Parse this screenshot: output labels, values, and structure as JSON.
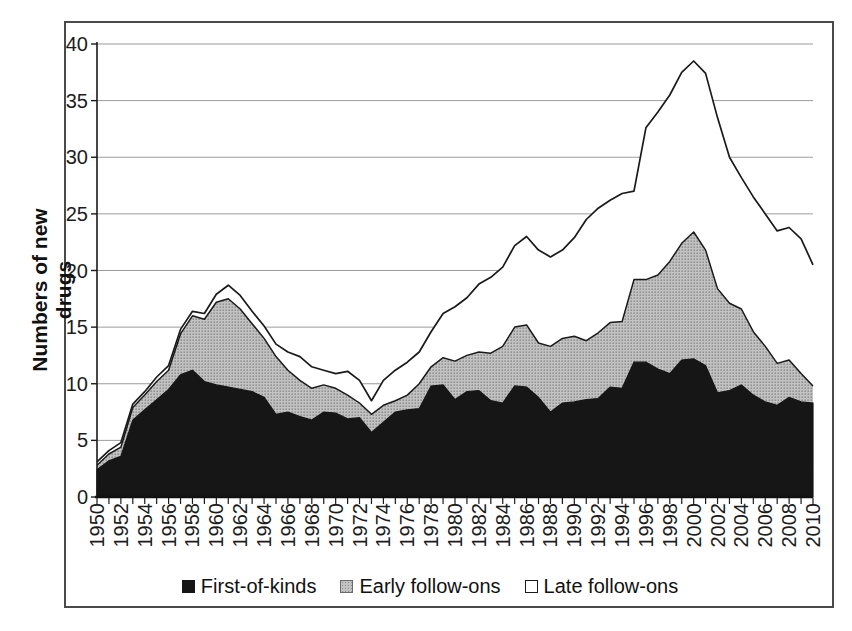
{
  "chart_data": {
    "type": "area",
    "stacked": true,
    "title": "",
    "xlabel": "",
    "ylabel": "Numbers of new drugs",
    "ylim": [
      0,
      40
    ],
    "ytick_step": 5,
    "grid": true,
    "legend_position": "bottom",
    "x": [
      1950,
      1951,
      1952,
      1953,
      1954,
      1955,
      1956,
      1957,
      1958,
      1959,
      1960,
      1961,
      1962,
      1963,
      1964,
      1965,
      1966,
      1967,
      1968,
      1969,
      1970,
      1971,
      1972,
      1973,
      1974,
      1975,
      1976,
      1977,
      1978,
      1979,
      1980,
      1981,
      1982,
      1983,
      1984,
      1985,
      1986,
      1987,
      1988,
      1989,
      1990,
      1991,
      1992,
      1993,
      1994,
      1995,
      1996,
      1997,
      1998,
      1999,
      2000,
      2001,
      2002,
      2003,
      2004,
      2005,
      2006,
      2007,
      2008,
      2009,
      2010
    ],
    "y_tick_labels": [
      "40",
      "35",
      "30",
      "25",
      "20",
      "15",
      "10",
      "5",
      "0"
    ],
    "x_tick_labels": [
      "1950",
      "1952",
      "1954",
      "1956",
      "1958",
      "1960",
      "1962",
      "1964",
      "1966",
      "1968",
      "1970",
      "1972",
      "1974",
      "1976",
      "1978",
      "1980",
      "1982",
      "1984",
      "1986",
      "1988",
      "1990",
      "1992",
      "1994",
      "1996",
      "1998",
      "2000",
      "2002",
      "2004",
      "2006",
      "2008",
      "2010"
    ],
    "series": [
      {
        "name": "First-of-kinds",
        "color": "#161616",
        "values": [
          2.4,
          3.2,
          3.6,
          6.8,
          7.7,
          8.6,
          9.5,
          10.8,
          11.2,
          10.2,
          9.9,
          9.7,
          9.5,
          9.3,
          8.8,
          7.3,
          7.5,
          7.1,
          6.8,
          7.5,
          7.4,
          6.9,
          7.0,
          5.7,
          6.6,
          7.5,
          7.7,
          7.8,
          9.8,
          9.9,
          8.6,
          9.3,
          9.4,
          8.5,
          8.3,
          9.8,
          9.7,
          8.8,
          7.5,
          8.3,
          8.4,
          8.6,
          8.7,
          9.7,
          9.6,
          11.9,
          11.9,
          11.3,
          10.9,
          12.1,
          12.2,
          11.6,
          9.2,
          9.4,
          9.9,
          9.0,
          8.4,
          8.1,
          8.8,
          8.4,
          8.3
        ]
      },
      {
        "name": "Early follow-ons",
        "color": "#b5b5b5",
        "values": [
          0.4,
          0.6,
          0.8,
          1.1,
          1.3,
          1.6,
          1.7,
          3.6,
          4.8,
          5.5,
          7.3,
          7.8,
          7.1,
          6.0,
          5.2,
          5.1,
          3.7,
          3.2,
          2.8,
          2.4,
          2.2,
          2.1,
          1.3,
          1.6,
          1.5,
          1.0,
          1.3,
          2.2,
          1.7,
          2.4,
          3.4,
          3.2,
          3.4,
          4.2,
          5.0,
          5.2,
          5.5,
          4.8,
          5.8,
          5.7,
          5.8,
          5.2,
          5.8,
          5.7,
          5.9,
          7.3,
          7.3,
          8.3,
          9.9,
          10.3,
          11.2,
          10.2,
          9.2,
          7.7,
          6.7,
          5.6,
          4.9,
          3.7,
          3.3,
          2.5,
          1.5
        ]
      },
      {
        "name": "Late follow-ons",
        "color": "#ffffff",
        "values": [
          0.3,
          0.3,
          0.4,
          0.3,
          0.3,
          0.4,
          0.4,
          0.4,
          0.4,
          0.5,
          0.7,
          1.2,
          1.2,
          1.1,
          1.1,
          1.1,
          1.6,
          2.1,
          1.9,
          1.3,
          1.3,
          2.1,
          2.0,
          1.2,
          2.2,
          2.7,
          2.9,
          2.8,
          3.1,
          3.9,
          4.8,
          5.1,
          6.0,
          6.7,
          7.0,
          7.2,
          7.8,
          8.2,
          7.9,
          7.8,
          8.7,
          10.7,
          11.0,
          10.8,
          11.3,
          7.8,
          13.4,
          14.4,
          14.7,
          15.1,
          15.1,
          15.6,
          15.1,
          12.9,
          11.6,
          11.9,
          11.7,
          11.7,
          11.7,
          11.9,
          10.7
        ]
      }
    ]
  },
  "legend": {
    "items": [
      {
        "label": "First-of-kinds",
        "swatch": "first"
      },
      {
        "label": "Early follow-ons",
        "swatch": "early"
      },
      {
        "label": "Late follow-ons",
        "swatch": "late"
      }
    ]
  },
  "colors": {
    "outline": "#1a1a1a",
    "grid": "#9c9c9c",
    "figure_border": "#4a4a4a",
    "background": "#ffffff",
    "first_of_kinds_fill": "#161616",
    "early_follow_ons_fill": "#b5b5b5",
    "late_follow_ons_fill": "#ffffff"
  }
}
